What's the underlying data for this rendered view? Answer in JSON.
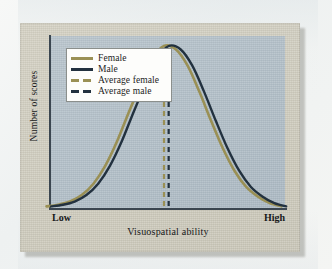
{
  "figure": {
    "y_axis_title": "Number of scores",
    "x_axis_title": "Visuospatial ability",
    "x_tick_low": "Low",
    "x_tick_high": "High"
  },
  "legend": {
    "items": [
      {
        "label": "Female",
        "style": "solid",
        "color": "#9a9055",
        "icon": "line-swatch-icon"
      },
      {
        "label": "Male",
        "style": "solid",
        "color": "#22313f",
        "icon": "line-swatch-icon"
      },
      {
        "label": "Average female",
        "style": "dashed",
        "color": "#9a9055",
        "icon": "dashed-line-swatch-icon"
      },
      {
        "label": "Average male",
        "style": "dashed",
        "color": "#22313f",
        "icon": "dashed-line-swatch-icon"
      }
    ]
  },
  "colors": {
    "page_background": "#f2f3f1",
    "card_background": "#cfccbe",
    "plot_background": "#b1bec7",
    "axis": "#3b4650",
    "female": "#9a9055",
    "male": "#22313f",
    "legend_background": "#fdfdfb"
  },
  "chart_data": {
    "type": "line",
    "title": "",
    "subtitle": "",
    "xlabel": "Visuospatial ability",
    "ylabel": "Number of scores",
    "xlim": [
      0,
      100
    ],
    "ylim": [
      0,
      100
    ],
    "grid": false,
    "legend_position": "top-left",
    "xticklabels": [
      "Low",
      "High"
    ],
    "yticklabels": [],
    "annotations": [
      {
        "name": "average-female-line",
        "type": "vline",
        "x": 48.5,
        "style": "dashed",
        "color": "#9a9055",
        "label": "Average female"
      },
      {
        "name": "average-male-line",
        "type": "vline",
        "x": 50.5,
        "style": "dashed",
        "color": "#22313f",
        "label": "Average male"
      }
    ],
    "x": [
      0,
      5,
      10,
      15,
      20,
      25,
      30,
      35,
      40,
      45,
      50,
      55,
      60,
      65,
      70,
      75,
      80,
      85,
      90,
      95,
      100
    ],
    "series": [
      {
        "name": "Female",
        "color": "#9a9055",
        "style": "solid",
        "mean": 48.5,
        "values": [
          1,
          2,
          4,
          8,
          15,
          26,
          41,
          59,
          76,
          92,
          100,
          98,
          88,
          72,
          54,
          37,
          23,
          13,
          7,
          3,
          1
        ]
      },
      {
        "name": "Male",
        "color": "#22313f",
        "style": "solid",
        "mean": 50.5,
        "values": [
          1,
          2,
          4,
          8,
          15,
          26,
          41,
          59,
          76,
          92,
          100,
          98,
          88,
          72,
          54,
          37,
          23,
          13,
          7,
          3,
          1
        ]
      }
    ]
  }
}
